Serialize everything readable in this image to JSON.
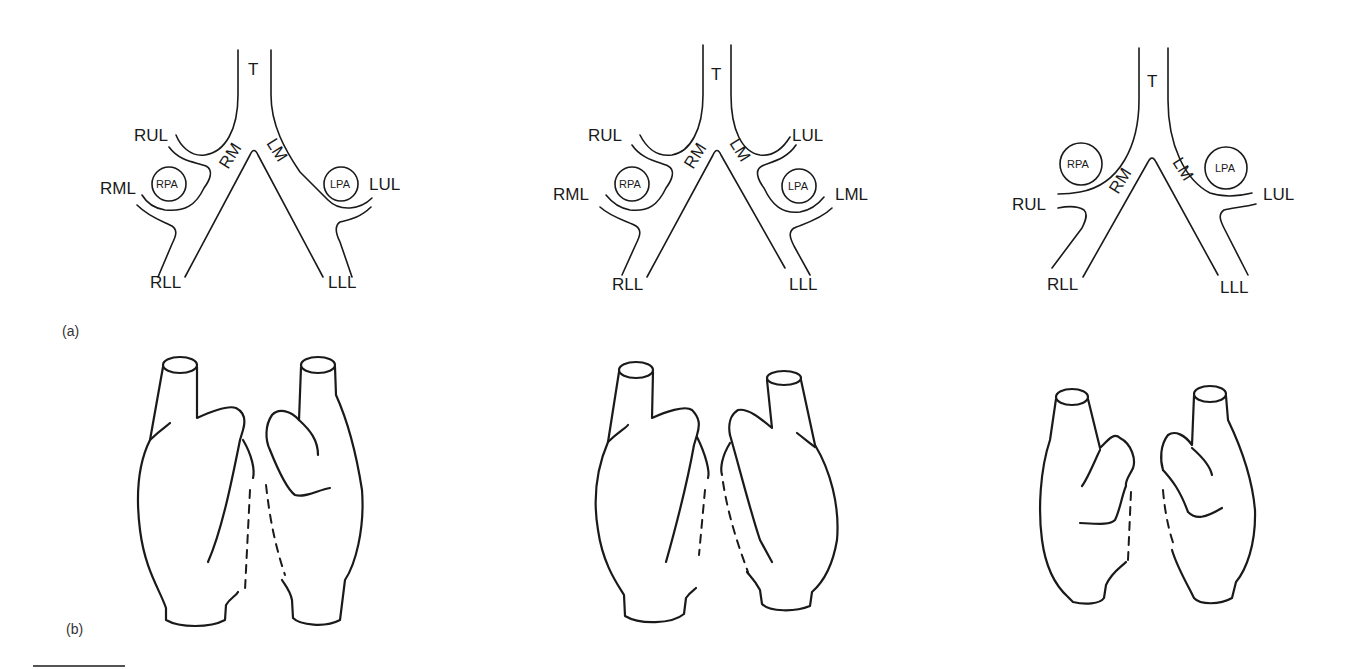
{
  "figure": {
    "panel_labels": {
      "a": "(a)",
      "b": "(b)"
    },
    "diagrams": [
      {
        "id": "variant-1",
        "labels": {
          "trachea": "T",
          "right_main": "RM",
          "left_main": "LM",
          "right_upper": "RUL",
          "right_middle": "RML",
          "right_lower": "RLL",
          "left_upper": "LUL",
          "left_lower": "LLL",
          "rpa": "RPA",
          "lpa": "LPA"
        }
      },
      {
        "id": "variant-2",
        "labels": {
          "trachea": "T",
          "right_main": "RM",
          "left_main": "LM",
          "right_upper": "RUL",
          "right_middle": "RML",
          "right_lower": "RLL",
          "left_upper": "LUL",
          "left_middle": "LML",
          "left_lower": "LLL",
          "rpa": "RPA",
          "lpa": "LPA"
        }
      },
      {
        "id": "variant-3",
        "labels": {
          "trachea": "T",
          "right_main": "RM",
          "left_main": "LM",
          "right_upper": "RUL",
          "right_lower": "RLL",
          "left_upper": "LUL",
          "left_lower": "LLL",
          "rpa": "RPA",
          "lpa": "LPA"
        }
      }
    ],
    "lung_sketches": [
      {
        "id": "lungs-1",
        "description": "right lung three lobes, left lung two lobes (normal)"
      },
      {
        "id": "lungs-2",
        "description": "bilateral right-sided morphology"
      },
      {
        "id": "lungs-3",
        "description": "bilateral left-sided morphology"
      }
    ]
  },
  "colors": {
    "ink": "#1a1a1a",
    "background": "#ffffff"
  }
}
